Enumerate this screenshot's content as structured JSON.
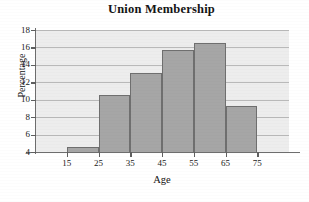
{
  "chart_data": {
    "type": "bar",
    "title": "Union Membership",
    "xlabel": "Age",
    "ylabel": "Percentage",
    "categories": [
      "15",
      "25",
      "35",
      "45",
      "55",
      "65"
    ],
    "bin_edges": [
      15,
      25,
      35,
      45,
      55,
      65,
      75
    ],
    "values": [
      4.6,
      10.5,
      13.1,
      15.7,
      16.5,
      9.3
    ],
    "xlim": [
      5,
      85
    ],
    "ylim": [
      4,
      18
    ],
    "x_ticks": [
      "15",
      "25",
      "35",
      "45",
      "55",
      "65",
      "75"
    ],
    "x_tick_values": [
      15,
      25,
      35,
      45,
      55,
      65,
      75
    ],
    "y_ticks": [
      "4",
      "6",
      "8",
      "10",
      "12",
      "14",
      "16",
      "18"
    ],
    "y_tick_values": [
      4,
      6,
      8,
      10,
      12,
      14,
      16,
      18
    ],
    "grid": "horizontal",
    "legend": "none",
    "colors": {
      "bar_fill": "#a6a6a6",
      "bar_edge": "#6f6f6f",
      "plot_background": "#ededed",
      "gridline": "#b9b9b9",
      "axis": "#6d6d6d",
      "text": "#141414"
    }
  }
}
